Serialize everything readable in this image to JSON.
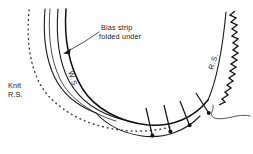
{
  "figure": {
    "type": "technical-sewing-illustration",
    "width": 253,
    "height": 154,
    "background_color": "#ffffff",
    "ink_color": "#1a1a1a"
  },
  "labels": {
    "callout": {
      "name": "bias-strip-callout",
      "line1": "Bias strip",
      "line2": "folded under",
      "x": 101,
      "y": 28,
      "leader_to_x": 63,
      "leader_to_y": 53
    },
    "knit_rs": {
      "name": "knit-right-side-label",
      "line1": "Knit",
      "line2": "R.S.",
      "x": 8,
      "y": 86
    },
    "bias_ws": {
      "name": "bias-wrong-side-label",
      "text": "W.S.",
      "x": 68,
      "y": 72,
      "rotation": 72
    },
    "bias_rs": {
      "name": "bias-right-side-label",
      "text": "R.S.",
      "x": 213,
      "y": 70,
      "rotation": -72
    }
  },
  "elements": {
    "dotted_edge": {
      "name": "knit-raw-edge-dotted",
      "description": "dotted curve indicating hidden knit fabric edge"
    },
    "zigzag_edge": {
      "name": "zigzag-stitch-edge",
      "description": "serrated zigzag line along right bias strip raw edge"
    },
    "pins": {
      "name": "straight-pins",
      "count": 4,
      "description": "straight pins with round heads holding bias strip to knit"
    },
    "fold_curves": {
      "name": "bias-strip-fold-lines",
      "count": 4,
      "description": "nested curves showing bias strip layers and fold"
    },
    "thread_tail": {
      "name": "thread-tail",
      "description": "loose thread tail at lower right"
    }
  }
}
